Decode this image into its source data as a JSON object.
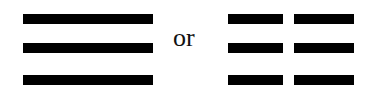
{
  "diagram": {
    "left_figure": {
      "name": "solid-lines",
      "lines": [
        "solid",
        "solid",
        "solid"
      ]
    },
    "separator_text": "or",
    "right_figure": {
      "name": "broken-lines",
      "lines": [
        "broken",
        "broken",
        "broken"
      ]
    },
    "colors": {
      "line": "#000000",
      "background": "#ffffff"
    }
  }
}
